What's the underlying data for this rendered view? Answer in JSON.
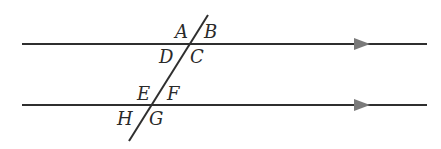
{
  "diagram": {
    "type": "parallel-lines-cut-by-transversal",
    "colors": {
      "line": "#2f2f2f",
      "arrow": "#7a7a7a",
      "label": "#2a2a2a",
      "background": "#ffffff"
    },
    "lines": [
      {
        "id": "line-1",
        "x1": 22,
        "y1": 44,
        "x2": 427,
        "y2": 44,
        "arrow_x": 362
      },
      {
        "id": "line-2",
        "x1": 22,
        "y1": 105,
        "x2": 427,
        "y2": 105,
        "arrow_x": 362
      }
    ],
    "transversal": {
      "x1": 208,
      "y1": 15,
      "x2": 129,
      "y2": 141
    },
    "intersection_1": {
      "labels": {
        "A": "A",
        "B": "B",
        "C": "C",
        "D": "D"
      }
    },
    "intersection_2": {
      "labels": {
        "E": "E",
        "F": "F",
        "G": "G",
        "H": "H"
      }
    }
  }
}
